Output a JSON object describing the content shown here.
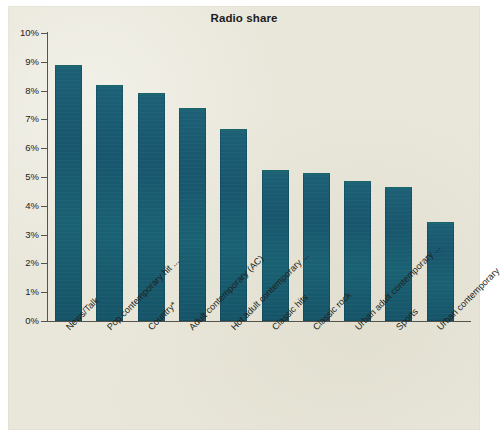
{
  "figure": {
    "title": "Radio share",
    "background_color": "#e9e7da",
    "bar_color": "#1a6173",
    "axis_color": "#55544c"
  },
  "chart_data": {
    "type": "bar",
    "title": "Radio share",
    "xlabel": "",
    "ylabel": "",
    "ylim": [
      0,
      10
    ],
    "ytick_labels": [
      "0%",
      "1%",
      "2%",
      "3%",
      "4%",
      "5%",
      "6%",
      "7%",
      "8%",
      "9%",
      "10%"
    ],
    "ytick_values": [
      0,
      1,
      2,
      3,
      4,
      5,
      6,
      7,
      8,
      9,
      10
    ],
    "grid": false,
    "legend": false,
    "categories": [
      "News/Talk",
      "Pop contemporary hit ...",
      "Country*",
      "Adult contemporary (AC)",
      "Hot adult contemporary ...",
      "Classic hits",
      "Classic rock",
      "Urban adult contemporary ...",
      "Sports",
      "Urban contemporary"
    ],
    "values": [
      8.9,
      8.2,
      7.9,
      7.4,
      6.65,
      5.25,
      5.15,
      4.85,
      4.65,
      3.45
    ],
    "value_labels": [
      "8.9%",
      "8.2%",
      "7.9%",
      "7.4%",
      "6.7%",
      "5.3%",
      "5.2%",
      "4.9%",
      "4.7%",
      "3.4%"
    ]
  }
}
